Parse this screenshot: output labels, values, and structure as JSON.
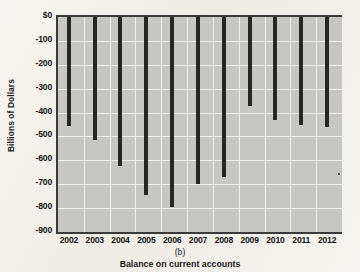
{
  "chart_data": {
    "type": "bar",
    "title": "",
    "subtitle": "",
    "panel_label": "(b)",
    "caption": "Balance on current accounts",
    "xlabel": "",
    "ylabel": "Billions of Dollars",
    "categories": [
      "2002",
      "2003",
      "2004",
      "2005",
      "2006",
      "2007",
      "2008",
      "2009",
      "2010",
      "2011",
      "2012"
    ],
    "values": [
      -455,
      -515,
      -625,
      -745,
      -795,
      -700,
      -670,
      -372,
      -430,
      -450,
      -460
    ],
    "ylim": [
      -900,
      0
    ],
    "yticks": [
      0,
      -100,
      -200,
      -300,
      -400,
      -500,
      -600,
      -700,
      -800,
      -900
    ],
    "ytick_labels": [
      "$0",
      "-100",
      "-200",
      "-300",
      "-400",
      "-500",
      "-600",
      "-700",
      "-800",
      "-900"
    ],
    "grid": true,
    "legend": false,
    "series": [
      {
        "name": "Balance on current accounts",
        "values": [
          -455,
          -515,
          -625,
          -745,
          -795,
          -700,
          -670,
          -372,
          -430,
          -450,
          -460
        ]
      }
    ],
    "colors": {
      "bar": "#262626",
      "plot_background": "#c6c6c4",
      "gridline": "#f2f2f0",
      "axis": "#3a3a3a",
      "page_background": "#f4f2ee",
      "text": "#1a1a1a"
    }
  }
}
